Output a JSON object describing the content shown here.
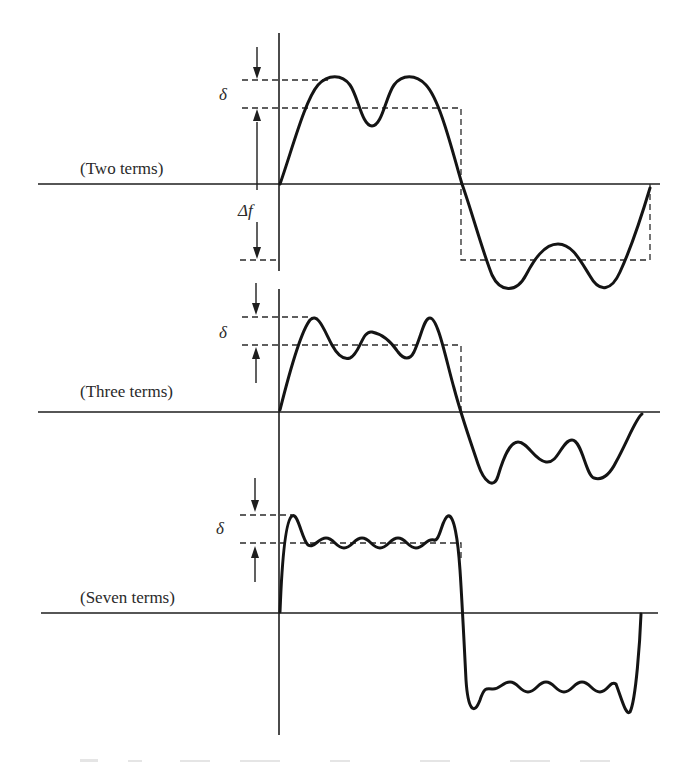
{
  "figure": {
    "panels": [
      {
        "label": "(Two terms)",
        "terms": 2,
        "delta_symbol": "δ",
        "delta_f_symbol": "Δf"
      },
      {
        "label": "(Three terms)",
        "terms": 3,
        "delta_symbol": "δ"
      },
      {
        "label": "(Seven terms)",
        "terms": 7,
        "delta_symbol": "δ"
      }
    ],
    "colors": {
      "ink": "#141414",
      "background": "#ffffff"
    }
  }
}
